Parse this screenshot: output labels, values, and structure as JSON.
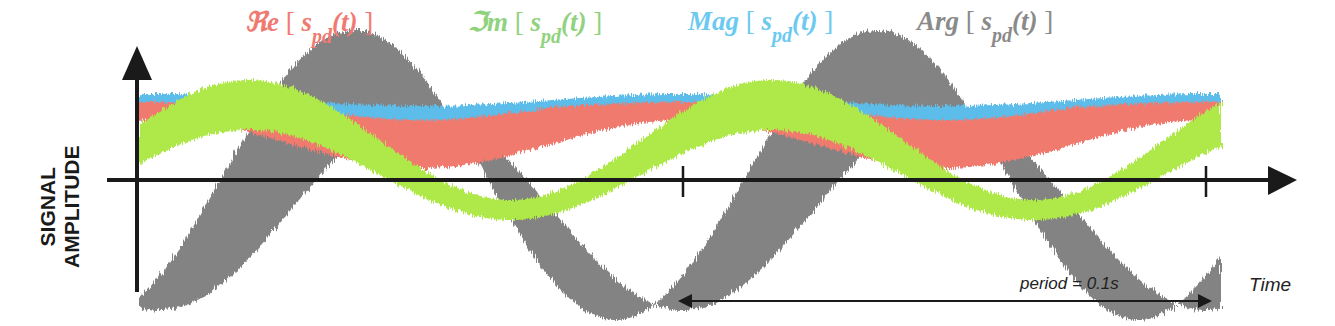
{
  "legend": [
    {
      "name": "ℜe",
      "open": "[",
      "var": "s",
      "sub": "pd",
      "arg": "(t)",
      "close": "]",
      "color": "#f07070",
      "series": "Re"
    },
    {
      "name": "ℑm",
      "open": "[",
      "var": "s",
      "sub": "pd",
      "arg": "(t)",
      "close": "]",
      "color": "#8ed47a",
      "series": "Im"
    },
    {
      "name": "Mag",
      "open": "[",
      "var": "s",
      "sub": "pd",
      "arg": "(t)",
      "close": "]",
      "color": "#6cc9ee",
      "series": "Mag"
    },
    {
      "name": "Arg",
      "open": "[",
      "var": "s",
      "sub": "pd",
      "arg": "(t)",
      "close": "]",
      "color": "#8a8a8a",
      "series": "Arg"
    }
  ],
  "axes": {
    "ylabel_line1": "SIGNAL",
    "ylabel_line2": "AMPLITUDE",
    "xlabel": "Time",
    "period_label": "period = 0.1s"
  },
  "colors": {
    "re": "#f07a6e",
    "im": "#aee94a",
    "mag": "#5bbcea",
    "arg": "#838383",
    "axis": "#1a1a1a"
  },
  "chart_data": {
    "type": "line",
    "title": "",
    "xlabel": "Time",
    "ylabel": "SIGNAL AMPLITUDE",
    "period_s": 0.1,
    "cycles_shown": 2,
    "annotations": [
      "period = 0.1s",
      "tick marks at start and end of one period"
    ],
    "series": [
      {
        "name": "Re[s_pd(t)]",
        "shape": "oscillates above zero, peaks at cycle edges, dips mid-cycle",
        "approx_range": [
          0.6,
          1.0
        ]
      },
      {
        "name": "Im[s_pd(t)]",
        "shape": "sinusoid crossing zero, negative trough mid-cycle",
        "approx_range": [
          -0.45,
          0.55
        ]
      },
      {
        "name": "Mag[s_pd(t)]",
        "shape": "near-constant upper envelope with slight dip mid-cycle",
        "approx_range": [
          0.85,
          1.0
        ]
      },
      {
        "name": "Arg[s_pd(t)]",
        "shape": "sinusoid with large negative trough mid-cycle and positive hump between cycles",
        "approx_range": [
          -1.3,
          1.2
        ]
      }
    ]
  }
}
